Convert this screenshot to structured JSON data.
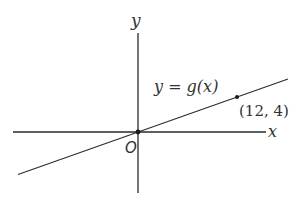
{
  "diagram": {
    "type": "coordinate-plane-line",
    "axes": {
      "x_label": "x",
      "y_label": "y",
      "origin_label": "O"
    },
    "function_label": "y = g(x)",
    "line": {
      "passes_through": [
        [
          0,
          0
        ],
        [
          12,
          4
        ]
      ],
      "slope": 0.3333
    },
    "marked_points": [
      {
        "x": 0,
        "y": 0,
        "label": ""
      },
      {
        "x": 12,
        "y": 4,
        "label": "(12, 4)"
      }
    ],
    "colors": {
      "ink": "#2a2a2a",
      "text": "#333333",
      "background": "#ffffff"
    }
  }
}
